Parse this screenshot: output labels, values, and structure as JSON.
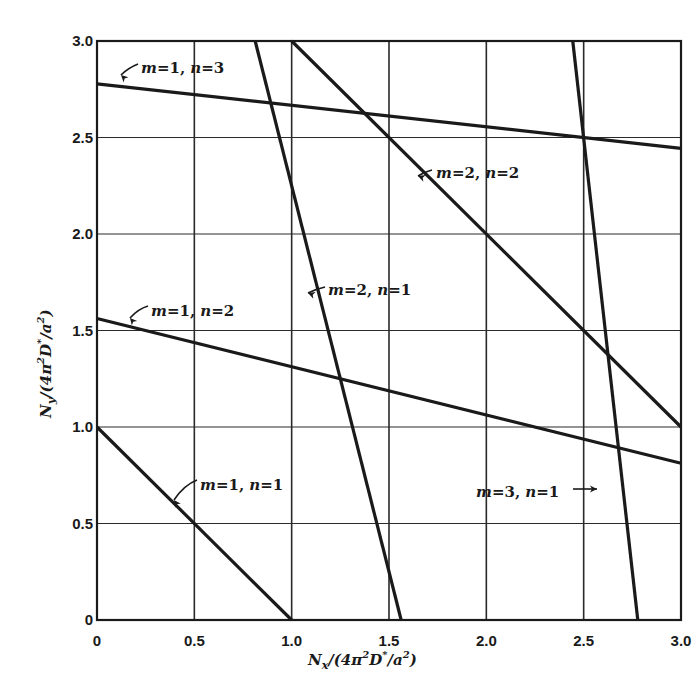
{
  "chart_data": {
    "type": "line",
    "title": "",
    "xlabel": "N_x/(4π²D*/a²)",
    "ylabel": "N_y/(4π²D*/a²)",
    "xlim": [
      0,
      3.0
    ],
    "ylim": [
      0,
      3.0
    ],
    "grid": true,
    "legend": "none (inline curve labels)",
    "x_ticks": [
      "0",
      "0.5",
      "1.0",
      "1.5",
      "2.0",
      "2.5",
      "3.0"
    ],
    "y_ticks": [
      "0",
      "0.5",
      "1.0",
      "1.5",
      "2.0",
      "2.5",
      "3.0"
    ],
    "series": [
      {
        "name": "m=1, n=1",
        "m": "1",
        "n": "1",
        "points": [
          [
            0,
            1.0
          ],
          [
            1.0,
            0
          ]
        ]
      },
      {
        "name": "m=1, n=2",
        "m": "1",
        "n": "2",
        "points": [
          [
            0,
            1.5625
          ],
          [
            3.0,
            0.8125
          ]
        ]
      },
      {
        "name": "m=1, n=3",
        "m": "1",
        "n": "3",
        "points": [
          [
            0,
            2.778
          ],
          [
            3.0,
            2.444
          ]
        ]
      },
      {
        "name": "m=2, n=1",
        "m": "2",
        "n": "1",
        "points": [
          [
            0.8125,
            3.0
          ],
          [
            1.5625,
            0
          ]
        ]
      },
      {
        "name": "m=2, n=2",
        "m": "2",
        "n": "2",
        "points": [
          [
            1.0,
            3.0
          ],
          [
            3.0,
            1.0
          ]
        ]
      },
      {
        "name": "m=3, n=1",
        "m": "3",
        "n": "1",
        "points": [
          [
            2.444,
            3.0
          ],
          [
            2.778,
            0
          ]
        ]
      }
    ]
  },
  "labels": {
    "x_axis": {
      "N": "N",
      "sub": "x",
      "rest": "/(4π",
      "sup1": "2",
      "D": "D",
      "star": "*",
      "slash_a": "/a",
      "sup2": "2",
      "close": ")"
    },
    "y_axis": {
      "N": "N",
      "sub": "y",
      "rest": "/(4π",
      "sup1": "2",
      "D": "D",
      "star": "*",
      "slash_a": "/a",
      "sup2": "2",
      "close": ")"
    },
    "curves": [
      {
        "m_var": "m",
        "m_val": "=1, ",
        "n_var": "n",
        "n_val": "=1"
      },
      {
        "m_var": "m",
        "m_val": "=1, ",
        "n_var": "n",
        "n_val": "=2"
      },
      {
        "m_var": "m",
        "m_val": "=1, ",
        "n_var": "n",
        "n_val": "=3"
      },
      {
        "m_var": "m",
        "m_val": "=2, ",
        "n_var": "n",
        "n_val": "=1"
      },
      {
        "m_var": "m",
        "m_val": "=2, ",
        "n_var": "n",
        "n_val": "=2"
      },
      {
        "m_var": "m",
        "m_val": "=3, ",
        "n_var": "n",
        "n_val": "=1"
      }
    ]
  },
  "colors": {
    "line": "#1a1a1a",
    "grid": "#2a2a2a",
    "background": "#ffffff"
  }
}
